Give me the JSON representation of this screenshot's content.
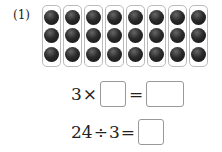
{
  "problem": {
    "number_label": "(1)",
    "grid": {
      "columns": 8,
      "rows": 3,
      "dot_color": "#222222",
      "group_border_color": "#bbbbbb"
    },
    "equation1": {
      "left": "3",
      "op": "×",
      "blank1": "",
      "equals": "=",
      "blank2": ""
    },
    "equation2": {
      "left": "24",
      "op": "÷",
      "right": "3",
      "equals": "=",
      "blank": ""
    }
  }
}
